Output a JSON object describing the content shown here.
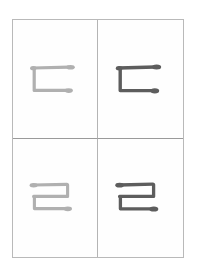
{
  "worksheet": {
    "title": "Hangul Consonant Practice Grid",
    "script": "Hangul",
    "background_color": "#ffffff",
    "sheet_color": "#fefefe",
    "border_color": "#b9b9b9",
    "grid_line_color": "#b4b4b4",
    "columns": 2,
    "rows": 2,
    "column_roles": [
      "trace",
      "model"
    ],
    "trace_color": "#b0b0b0",
    "model_color": "#5d5d5d",
    "cells": [
      {
        "position": "top-left",
        "character": "ㄷ",
        "character_name": "digeut",
        "romanization": "d",
        "style": "trace",
        "color": "#b0b0b0",
        "stroke_count": 2
      },
      {
        "position": "top-right",
        "character": "ㄷ",
        "character_name": "digeut",
        "romanization": "d",
        "style": "model",
        "color": "#5d5d5d",
        "stroke_count": 2
      },
      {
        "position": "bottom-left",
        "character": "ㄹ",
        "character_name": "rieul",
        "romanization": "r/l",
        "style": "trace",
        "color": "#b0b0b0",
        "stroke_count": 3
      },
      {
        "position": "bottom-right",
        "character": "ㄹ",
        "character_name": "rieul",
        "romanization": "r/l",
        "style": "model",
        "color": "#5d5d5d",
        "stroke_count": 3
      }
    ]
  }
}
